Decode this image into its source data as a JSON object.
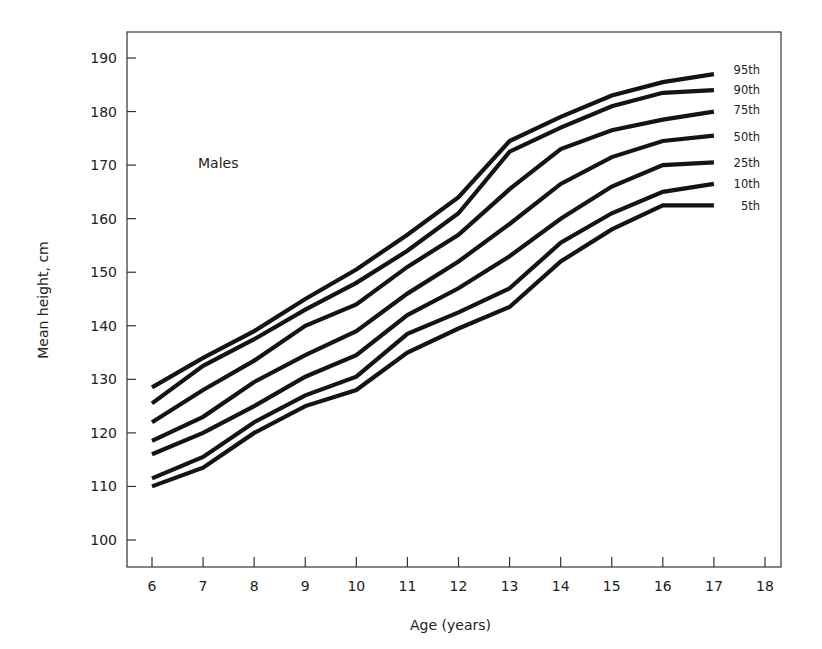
{
  "chart_data": {
    "type": "line",
    "title": "",
    "annotation": "Males",
    "xlabel": "Age (years)",
    "ylabel": "Mean height, cm",
    "xlim": [
      5.5,
      18.3
    ],
    "ylim": [
      95,
      192
    ],
    "x_ticks": [
      6,
      7,
      8,
      9,
      10,
      11,
      12,
      13,
      14,
      15,
      16,
      17,
      18
    ],
    "y_ticks": [
      100,
      110,
      120,
      130,
      140,
      150,
      160,
      170,
      180,
      190
    ],
    "grid": false,
    "legend_position": "right end of lines (inline labels)",
    "x": [
      6,
      7,
      8,
      9,
      10,
      11,
      12,
      13,
      14,
      15,
      16,
      17
    ],
    "series": [
      {
        "name": "95th",
        "values": [
          128.5,
          134,
          139,
          145,
          150.5,
          157,
          164,
          174.5,
          179,
          183,
          185.5,
          187
        ]
      },
      {
        "name": "90th",
        "values": [
          125.5,
          132.5,
          137.5,
          143,
          148,
          154,
          161,
          172.5,
          177,
          181,
          183.5,
          184
        ]
      },
      {
        "name": "75th",
        "values": [
          122,
          128,
          133.5,
          140,
          144,
          151,
          157,
          165.5,
          173,
          176.5,
          178.5,
          180
        ]
      },
      {
        "name": "50th",
        "values": [
          118.5,
          123,
          129.5,
          134.5,
          139,
          146,
          152,
          159,
          166.5,
          171.5,
          174.5,
          175.5
        ]
      },
      {
        "name": "25th",
        "values": [
          116,
          120,
          125,
          130.5,
          134.5,
          142,
          147,
          153,
          160,
          166,
          170,
          170.5
        ]
      },
      {
        "name": "10th",
        "values": [
          111.5,
          115.5,
          122,
          127,
          130.5,
          138.5,
          142.5,
          147,
          155.5,
          161,
          165,
          166.5
        ]
      },
      {
        "name": "5th",
        "values": [
          110,
          113.5,
          120,
          125,
          128,
          135,
          139.5,
          143.5,
          152,
          158,
          162.5,
          162.5
        ]
      }
    ],
    "label_y_px": [
      70,
      90,
      110,
      137,
      163,
      184,
      206
    ]
  },
  "layout": {
    "frame": {
      "left": 127,
      "top": 32,
      "right": 781,
      "bottom": 567
    },
    "x_px": {
      "6": 152,
      "18": 765
    },
    "y_px": {
      "100": 540,
      "190": 58
    },
    "line_color": "#141414"
  }
}
